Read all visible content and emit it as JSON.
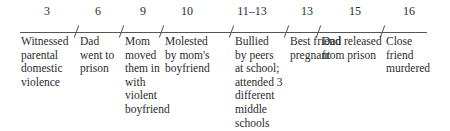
{
  "timeline": {
    "events": [
      {
        "age": "3",
        "label": "Witnessed\nparental\ndomestic\nviolence"
      },
      {
        "age": "6",
        "label": "Dad\nwent to\nprison"
      },
      {
        "age": "9",
        "label": "Mom\nmoved\nthem in\nwith\nviolent\nboyfriend"
      },
      {
        "age": "10",
        "label": "Molested\nby mom's\nboyfriend"
      },
      {
        "age": "11–13",
        "label": "Bullied\nby peers\nat school;\nattended 3\ndifferent\nmiddle\nschools"
      },
      {
        "age": "13",
        "label": "Best friend\npregnant"
      },
      {
        "age": "15",
        "label": "Dad released\nfrom prison"
      },
      {
        "age": "16",
        "label": "Close\nfriend\nmurdered"
      }
    ]
  }
}
